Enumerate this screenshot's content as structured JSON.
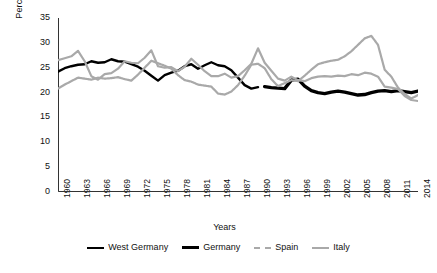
{
  "chart_data": {
    "type": "line",
    "title": "",
    "xlabel": "Years",
    "ylabel": "Percentage shares",
    "ylim": [
      0,
      35
    ],
    "yticks": [
      0,
      5,
      10,
      15,
      20,
      25,
      30,
      35
    ],
    "xlim": [
      1960,
      2014
    ],
    "xticks": [
      1960,
      1963,
      1966,
      1969,
      1972,
      1975,
      1978,
      1981,
      1984,
      1987,
      1990,
      1993,
      1996,
      1999,
      2002,
      2005,
      2008,
      2011,
      2014
    ],
    "grid": false,
    "legend_position": "bottom",
    "x": [
      1960,
      1961,
      1962,
      1963,
      1964,
      1965,
      1966,
      1967,
      1968,
      1969,
      1970,
      1971,
      1972,
      1973,
      1974,
      1975,
      1976,
      1977,
      1978,
      1979,
      1980,
      1981,
      1982,
      1983,
      1984,
      1985,
      1986,
      1987,
      1988,
      1989,
      1990,
      1991,
      1992,
      1993,
      1994,
      1995,
      1996,
      1997,
      1998,
      1999,
      2000,
      2001,
      2002,
      2003,
      2004,
      2005,
      2006,
      2007,
      2008,
      2009,
      2010,
      2011,
      2012,
      2013,
      2014
    ],
    "series": [
      {
        "name": "West Germany",
        "color": "#000000",
        "style": "solid",
        "width": 2.4,
        "x": [
          1960,
          1961,
          1962,
          1963,
          1964,
          1965,
          1966,
          1967,
          1968,
          1969,
          1970,
          1971,
          1972,
          1973,
          1974,
          1975,
          1976,
          1977,
          1978,
          1979,
          1980,
          1981,
          1982,
          1983,
          1984,
          1985,
          1986,
          1987,
          1988,
          1989,
          1990
        ],
        "values": [
          24.2,
          24.9,
          25.3,
          25.6,
          25.7,
          26.3,
          26.0,
          26.1,
          26.7,
          26.3,
          26.2,
          25.7,
          25.2,
          24.4,
          23.4,
          22.4,
          23.5,
          24.0,
          24.4,
          25.3,
          25.7,
          24.8,
          25.5,
          26.1,
          25.5,
          25.3,
          24.5,
          23.0,
          21.5,
          20.8,
          21.1
        ]
      },
      {
        "name": "Germany",
        "color": "#000000",
        "style": "solid",
        "width": 3.4,
        "x": [
          1991,
          1992,
          1993,
          1994,
          1995,
          1996,
          1997,
          1998,
          1999,
          2000,
          2001,
          2002,
          2003,
          2004,
          2005,
          2006,
          2007,
          2008,
          2009,
          2010,
          2011,
          2012,
          2013,
          2014
        ],
        "values": [
          21.2,
          21.0,
          20.9,
          20.8,
          22.5,
          22.7,
          21.3,
          20.4,
          20.0,
          19.8,
          20.1,
          20.3,
          20.1,
          19.8,
          19.5,
          19.6,
          20.0,
          20.3,
          20.4,
          20.2,
          20.4,
          20.2,
          20.0,
          20.3
        ]
      },
      {
        "name": "Spain",
        "color": "#a9a9a9",
        "style": "dashed",
        "width": 2.2,
        "x": [
          1960,
          1961,
          1962,
          1963,
          1964,
          1965,
          1966,
          1967,
          1968,
          1969,
          1970,
          1971,
          1972,
          1973,
          1974,
          1975,
          1976,
          1977,
          1978,
          1979,
          1980,
          1981,
          1982,
          1983,
          1984,
          1985,
          1986,
          1987,
          1988,
          1989,
          1990,
          1991,
          1992,
          1993,
          1994,
          1995,
          1996,
          1997,
          1998,
          1999,
          2000,
          2001,
          2002,
          2003,
          2004,
          2005,
          2006,
          2007,
          2008,
          2009,
          2010,
          2011,
          2012,
          2013,
          2014
        ],
        "values": [
          20.8,
          21.6,
          22.3,
          23.0,
          22.8,
          22.6,
          23.0,
          22.8,
          22.9,
          23.1,
          22.7,
          22.4,
          23.6,
          25.0,
          26.4,
          25.9,
          25.4,
          24.8,
          23.5,
          22.5,
          22.2,
          21.6,
          21.4,
          21.2,
          19.8,
          19.6,
          20.2,
          21.5,
          23.4,
          25.6,
          25.8,
          24.9,
          22.7,
          21.3,
          21.9,
          22.5,
          22.3,
          23.4,
          24.6,
          25.7,
          26.1,
          26.4,
          26.6,
          27.3,
          28.3,
          29.6,
          30.9,
          31.4,
          29.6,
          24.6,
          23.2,
          21.0,
          19.7,
          18.8,
          19.5
        ]
      },
      {
        "name": "Italy",
        "color": "#a9a9a9",
        "style": "solid",
        "width": 2.2,
        "x": [
          1960,
          1961,
          1962,
          1963,
          1964,
          1965,
          1966,
          1967,
          1968,
          1969,
          1970,
          1971,
          1972,
          1973,
          1974,
          1975,
          1976,
          1977,
          1978,
          1979,
          1980,
          1981,
          1982,
          1983,
          1984,
          1985,
          1986,
          1987,
          1988,
          1989,
          1990,
          1991,
          1992,
          1993,
          1994,
          1995,
          1996,
          1997,
          1998,
          1999,
          2000,
          2001,
          2002,
          2003,
          2004,
          2005,
          2006,
          2007,
          2008,
          2009,
          2010,
          2011,
          2012,
          2013,
          2014
        ],
        "values": [
          26.5,
          26.9,
          27.3,
          28.4,
          26.3,
          23.3,
          22.6,
          23.7,
          23.9,
          24.8,
          26.3,
          26.0,
          25.9,
          27.0,
          28.5,
          25.3,
          25.0,
          25.1,
          24.3,
          25.2,
          26.8,
          25.6,
          24.3,
          23.3,
          23.3,
          23.8,
          23.0,
          23.3,
          24.5,
          25.8,
          28.9,
          26.0,
          24.4,
          22.8,
          22.4,
          23.2,
          22.5,
          22.3,
          22.9,
          23.2,
          23.3,
          23.2,
          23.4,
          23.3,
          23.7,
          23.5,
          24.0,
          23.8,
          23.2,
          21.2,
          21.0,
          20.7,
          19.3,
          18.5,
          18.3
        ]
      }
    ],
    "legend": [
      "West Germany",
      "Germany",
      "Spain",
      "Italy"
    ]
  }
}
